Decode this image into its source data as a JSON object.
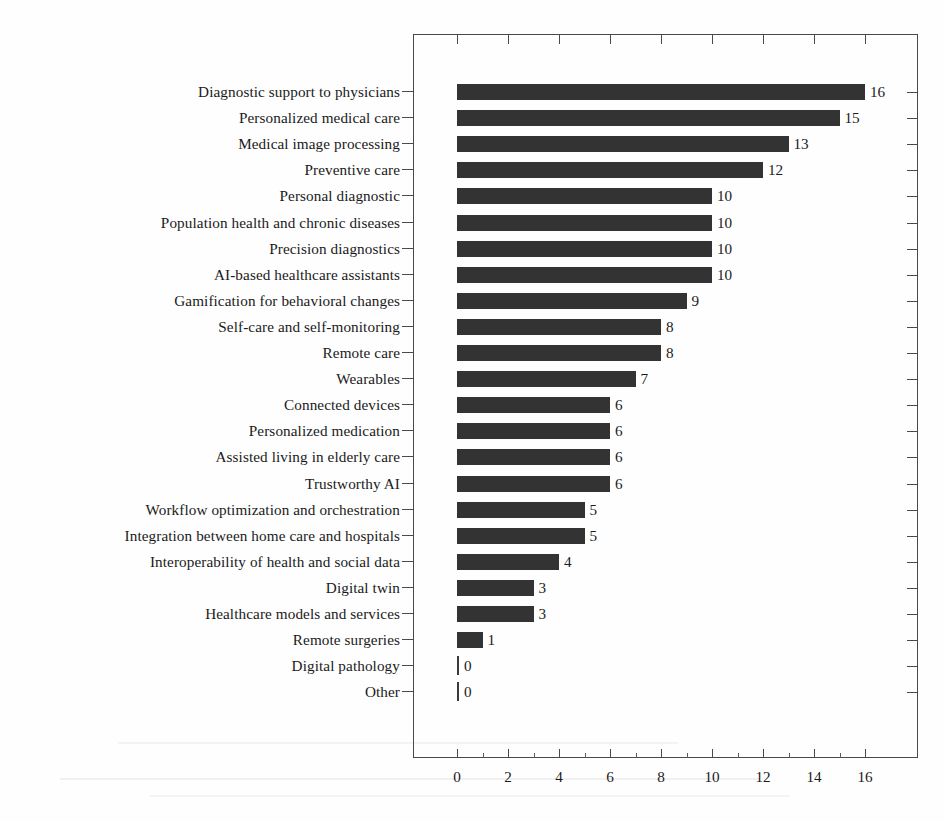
{
  "chart_data": {
    "type": "bar",
    "orientation": "horizontal",
    "title": "",
    "xlabel": "",
    "ylabel": "",
    "xlim": [
      0,
      17
    ],
    "grid": false,
    "legend": null,
    "bar_color": "#333333",
    "axis_color": "#4a4a4a",
    "xticks": [
      0,
      2,
      4,
      6,
      8,
      10,
      12,
      14,
      16
    ],
    "xtick_labels": [
      "0",
      "2",
      "4",
      "6",
      "8",
      "10",
      "12",
      "14",
      "16"
    ],
    "minor_xticks": [
      1,
      3,
      5,
      7,
      9,
      11,
      13,
      15
    ],
    "categories": [
      "Diagnostic support to physicians",
      "Personalized medical care",
      "Medical image processing",
      "Preventive care",
      "Personal diagnostic",
      "Population health and chronic diseases",
      "Precision diagnostics",
      "AI-based healthcare assistants",
      "Gamification for behavioral changes",
      "Self-care and self-monitoring",
      "Remote care",
      "Wearables",
      "Connected devices",
      "Personalized medication",
      "Assisted living in elderly care",
      "Trustworthy AI",
      "Workflow optimization and orchestration",
      "Integration between home care and hospitals",
      "Interoperability of health and social data",
      "Digital twin",
      "Healthcare models and services",
      "Remote surgeries",
      "Digital pathology",
      "Other"
    ],
    "values": [
      16,
      15,
      13,
      12,
      10,
      10,
      10,
      10,
      9,
      8,
      8,
      7,
      6,
      6,
      6,
      6,
      5,
      5,
      4,
      3,
      3,
      1,
      0,
      0
    ],
    "value_labels": [
      "16",
      "15",
      "13",
      "12",
      "10",
      "10",
      "10",
      "10",
      "9",
      "8",
      "8",
      "7",
      "6",
      "6",
      "6",
      "6",
      "5",
      "5",
      "4",
      "3",
      "3",
      "1",
      "0",
      "0"
    ]
  }
}
